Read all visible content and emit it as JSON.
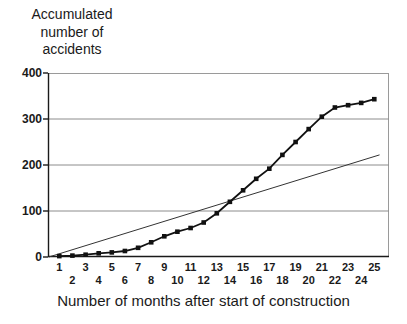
{
  "chart_data": {
    "type": "line",
    "title": "Accumulated number of accidents",
    "xlabel": "Number of months after start of construction",
    "x": [
      1,
      2,
      3,
      4,
      5,
      6,
      7,
      8,
      9,
      10,
      11,
      12,
      13,
      14,
      15,
      16,
      17,
      18,
      19,
      20,
      21,
      22,
      23,
      24,
      25
    ],
    "series": [
      {
        "name": "accumulated-accidents",
        "style": "line-with-square-markers",
        "color": "#111111",
        "values": [
          2,
          3,
          5,
          8,
          10,
          13,
          20,
          32,
          45,
          55,
          63,
          75,
          95,
          120,
          145,
          170,
          192,
          222,
          250,
          278,
          305,
          325,
          330,
          335,
          343
        ]
      },
      {
        "name": "linear-reference-line",
        "style": "thin-straight-line",
        "color": "#333333",
        "x_start": 0.2,
        "y_start": 0,
        "x_end": 25.4,
        "y_end": 222
      }
    ],
    "ylim": [
      0,
      400
    ],
    "yticks": [
      0,
      100,
      200,
      300,
      400
    ],
    "gridline_values": [
      100,
      200,
      300
    ],
    "legend": "none",
    "grid_on": true,
    "grid_color": "#8c8c8c",
    "frame_color": "#9a9a9a",
    "axis_color": "#1a1a1a"
  }
}
